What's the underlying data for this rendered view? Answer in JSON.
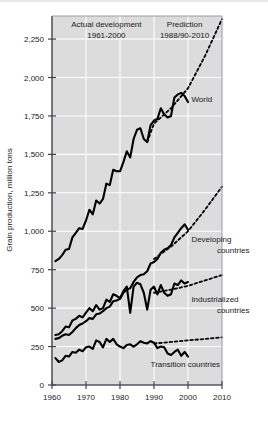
{
  "chart_data": {
    "type": "line",
    "title": "",
    "xlabel": "",
    "ylabel": "Grain production, million tons",
    "xlim": [
      1960,
      2010
    ],
    "ylim": [
      0,
      2400
    ],
    "grid": true,
    "legend_position": "inline-labels",
    "xticks": [
      "1960",
      "1970",
      "1980",
      "1990",
      "2000",
      "2010"
    ],
    "xtick_values": [
      1960,
      1970,
      1980,
      1990,
      2000,
      2010
    ],
    "yticks": [
      "0",
      "250",
      "500",
      "750",
      "1,000",
      "1,250",
      "1,500",
      "1,750",
      "2,000",
      "2,250"
    ],
    "ytick_values": [
      0,
      250,
      500,
      750,
      1000,
      1250,
      1500,
      1750,
      2000,
      2250
    ],
    "annotations": [
      {
        "name": "actual-development",
        "line1": "Actual development",
        "line2": "1961-2000",
        "x": 1976,
        "y": 2330
      },
      {
        "name": "prediction",
        "line1": "Prediction",
        "line2": "1988/90-2010",
        "x": 1999,
        "y": 2330
      }
    ],
    "series": [
      {
        "name": "World",
        "label": "World",
        "style": "solid",
        "label_x": 2001,
        "label_y": 1840,
        "x": [
          1961,
          1962,
          1963,
          1964,
          1965,
          1966,
          1967,
          1968,
          1969,
          1970,
          1971,
          1972,
          1973,
          1974,
          1975,
          1976,
          1977,
          1978,
          1979,
          1980,
          1981,
          1982,
          1983,
          1984,
          1985,
          1986,
          1987,
          1988,
          1989,
          1990,
          1991,
          1992,
          1993,
          1994,
          1995,
          1996,
          1997,
          1998,
          1999,
          2000
        ],
        "y": [
          805,
          820,
          845,
          880,
          885,
          960,
          990,
          1020,
          1015,
          1070,
          1140,
          1110,
          1200,
          1180,
          1210,
          1310,
          1300,
          1400,
          1390,
          1390,
          1450,
          1520,
          1480,
          1600,
          1660,
          1670,
          1600,
          1580,
          1690,
          1720,
          1730,
          1800,
          1760,
          1740,
          1750,
          1870,
          1890,
          1900,
          1880,
          1840
        ]
      },
      {
        "name": "World prediction",
        "label": "",
        "style": "dotted",
        "x": [
          1988,
          1990,
          1995,
          2000,
          2005,
          2010
        ],
        "y": [
          1580,
          1700,
          1800,
          1930,
          2140,
          2380
        ]
      },
      {
        "name": "Developing countries",
        "label": "Developing\ncountries",
        "label_line1": "Developing",
        "label_line2": "countries",
        "style": "solid",
        "label_x": 2001,
        "label_y": 930,
        "x": [
          1961,
          1962,
          1963,
          1964,
          1965,
          1966,
          1967,
          1968,
          1969,
          1970,
          1971,
          1972,
          1973,
          1974,
          1975,
          1976,
          1977,
          1978,
          1979,
          1980,
          1981,
          1982,
          1983,
          1984,
          1985,
          1986,
          1987,
          1988,
          1989,
          1990,
          1991,
          1992,
          1993,
          1994,
          1995,
          1996,
          1997,
          1998,
          1999,
          2000
        ],
        "y": [
          300,
          305,
          320,
          330,
          325,
          345,
          370,
          390,
          400,
          415,
          435,
          430,
          460,
          465,
          480,
          500,
          510,
          545,
          550,
          560,
          600,
          620,
          630,
          670,
          700,
          715,
          720,
          740,
          790,
          800,
          820,
          860,
          880,
          890,
          910,
          960,
          990,
          1020,
          1045,
          1010
        ]
      },
      {
        "name": "Developing countries prediction",
        "label": "",
        "style": "dotted",
        "x": [
          1990,
          1995,
          2000,
          2005,
          2010
        ],
        "y": [
          820,
          900,
          1000,
          1140,
          1290
        ]
      },
      {
        "name": "Industrialized countries",
        "label": "Industrialized\ncountries",
        "label_line1": "Industrialized",
        "label_line2": "countries",
        "style": "solid",
        "label_x": 2001,
        "label_y": 540,
        "x": [
          1961,
          1962,
          1963,
          1964,
          1965,
          1966,
          1967,
          1968,
          1969,
          1970,
          1971,
          1972,
          1973,
          1974,
          1975,
          1976,
          1977,
          1978,
          1979,
          1980,
          1981,
          1982,
          1983,
          1984,
          1985,
          1986,
          1987,
          1988,
          1989,
          1990,
          1991,
          1992,
          1993,
          1994,
          1995,
          1996,
          1997,
          1998,
          1999,
          2000
        ],
        "y": [
          325,
          330,
          350,
          380,
          375,
          420,
          430,
          450,
          440,
          470,
          500,
          480,
          520,
          490,
          500,
          555,
          540,
          590,
          580,
          565,
          610,
          640,
          470,
          640,
          665,
          655,
          600,
          490,
          620,
          640,
          590,
          650,
          600,
          580,
          590,
          660,
          650,
          680,
          660,
          670
        ]
      },
      {
        "name": "Industrialized countries prediction",
        "label": "",
        "style": "dotted",
        "x": [
          1990,
          1995,
          2000,
          2005,
          2010
        ],
        "y": [
          600,
          620,
          645,
          680,
          715
        ]
      },
      {
        "name": "Transition countries",
        "label": "Transition countries",
        "style": "solid",
        "label_x": 1989,
        "label_y": 120,
        "x": [
          1961,
          1962,
          1963,
          1964,
          1965,
          1966,
          1967,
          1968,
          1969,
          1970,
          1971,
          1972,
          1973,
          1974,
          1975,
          1976,
          1977,
          1978,
          1979,
          1980,
          1981,
          1982,
          1983,
          1984,
          1985,
          1986,
          1987,
          1988,
          1989,
          1990,
          1991,
          1992,
          1993,
          1994,
          1995,
          1996,
          1997,
          1998,
          1999,
          2000
        ],
        "y": [
          175,
          150,
          160,
          190,
          185,
          215,
          210,
          230,
          220,
          245,
          250,
          235,
          290,
          280,
          245,
          300,
          280,
          300,
          265,
          250,
          240,
          260,
          265,
          250,
          265,
          285,
          275,
          270,
          285,
          275,
          240,
          250,
          245,
          205,
          195,
          215,
          230,
          190,
          215,
          185
        ]
      },
      {
        "name": "Transition countries prediction",
        "label": "",
        "style": "dotted",
        "x": [
          1990,
          1995,
          2000,
          2005,
          2010
        ],
        "y": [
          270,
          280,
          290,
          300,
          310
        ]
      }
    ]
  },
  "colors": {
    "plot_background": "#dcdcdc",
    "gridline": "#ffffff",
    "series_line": "#000000",
    "axis": "#555566",
    "text": "#1a1a1a",
    "page_background": "#ffffff"
  }
}
